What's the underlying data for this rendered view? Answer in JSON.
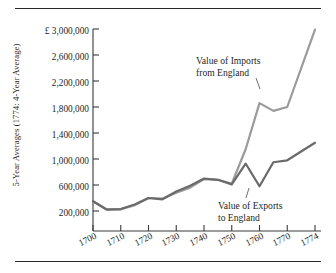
{
  "figure": {
    "name": "trade-value-line-chart",
    "axis_label_y": "5-Year Averages (1774: 4-Year Average)",
    "currency_symbol": "£"
  },
  "annotations": {
    "imports": {
      "line1": "Value of Imports",
      "line2": "from England"
    },
    "exports": {
      "line1": "Value of Exports",
      "line2": "to England"
    }
  },
  "colors": {
    "imports_line": "#9b9b9b",
    "exports_line": "#6a6a6a",
    "axis": "#3a3a3a",
    "text": "#231f1f",
    "rule": "#2a2a2a"
  },
  "chart_data": {
    "type": "line",
    "title": "",
    "xlabel": "",
    "ylabel": "5-Year Averages (1774: 4-Year Average)",
    "xlim": [
      1700,
      1774
    ],
    "ylim": [
      0,
      3000000
    ],
    "grid": false,
    "legend": "annotated-inline",
    "y_ticks": [
      200000,
      600000,
      1000000,
      1400000,
      1800000,
      2200000,
      2600000,
      3000000
    ],
    "y_tick_labels": [
      "200,000",
      "600,000",
      "1,000,000",
      "1,400,000",
      "1,800,000",
      "2,200,000",
      "2,600,000",
      "£ 3,000,000"
    ],
    "x_ticks": [
      1700,
      1710,
      1720,
      1730,
      1740,
      1750,
      1760,
      1770,
      1774
    ],
    "x_tick_labels": [
      "1700",
      "1710",
      "1720",
      "1730",
      "1740",
      "1750",
      "1760",
      "1770",
      "1774"
    ],
    "x": [
      1700,
      1705,
      1710,
      1715,
      1720,
      1725,
      1730,
      1735,
      1740,
      1745,
      1750,
      1755,
      1760,
      1765,
      1770,
      1774
    ],
    "series": [
      {
        "name": "Value of Imports from England",
        "color": "#9b9b9b",
        "values": [
          350000,
          225000,
          225000,
          290000,
          400000,
          390000,
          480000,
          560000,
          690000,
          680000,
          620000,
          1150000,
          1860000,
          1740000,
          1800000,
          2990000
        ]
      },
      {
        "name": "Value of Exports to England",
        "color": "#6a6a6a",
        "values": [
          350000,
          220000,
          230000,
          300000,
          400000,
          380000,
          500000,
          590000,
          700000,
          680000,
          610000,
          930000,
          580000,
          950000,
          980000,
          1250000
        ]
      }
    ]
  }
}
